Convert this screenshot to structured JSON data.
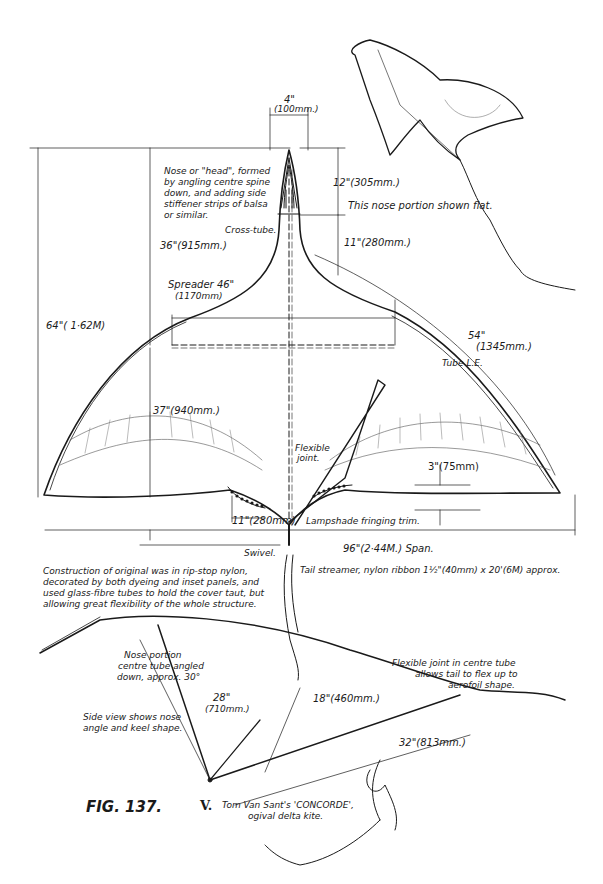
{
  "figure": {
    "number": "FIG. 137.",
    "numeral": "V.",
    "caption_line1": "Tom Van Sant's 'CONCORDE',",
    "caption_line2": "ogival delta kite."
  },
  "plan_view": {
    "nose_width": {
      "inch": "4\"",
      "mm": "(100mm.)"
    },
    "nose_note": [
      "Nose or \"head\", formed",
      "by angling centre spine",
      "down, and adding side",
      "stiffener strips of balsa",
      "or similar."
    ],
    "cross_tube": "Cross-tube.",
    "nose_length": "12\"(305mm.)",
    "nose_flat_note": "This nose portion shown flat.",
    "neck_length": "11\"(280mm.)",
    "head_to_spreader": "36\"(915mm.)",
    "overall_height": "64\"( 1·62M)",
    "spreader": {
      "line1": "Spreader 46\"",
      "line2": "(1170mm)"
    },
    "leading_edge": {
      "inch": "54\"",
      "mm": "(1345mm.)"
    },
    "tube_le": "Tube L.E.",
    "lower_height": "37\"(940mm.)",
    "flexible_joint": [
      "Flexible",
      "joint."
    ],
    "trailing_drop": "3\"(75mm)",
    "trim_width": "11\"(280mm)",
    "lampshade": "Lampshade fringing trim.",
    "swivel": "Swivel.",
    "span": "96\"(2·44M.) Span.",
    "tail_streamer": "Tail streamer, nylon ribbon 1½\"(40mm) x 20'(6M) approx."
  },
  "construction_note": [
    "Construction of original was in rip-stop nylon,",
    "decorated by both dyeing and inset panels, and",
    "used glass-fibre tubes to hold the cover taut, but",
    "allowing great flexibility of the whole structure."
  ],
  "side_view": {
    "nose_note": [
      "Nose portion",
      "centre tube angled",
      "down, approx. 30°"
    ],
    "side_note": [
      "Side view shows nose",
      "angle and keel shape."
    ],
    "keel_front": {
      "inch": "28\"",
      "mm": "(710mm.)"
    },
    "keel_height": "18\"(460mm.)",
    "keel_rear": "32\"(813mm.)",
    "flex_note": [
      "Flexible joint in centre tube",
      "allows tail to flex up to",
      "aerofoil shape."
    ]
  },
  "colors": {
    "ink": "#1a1a1a",
    "paper": "#ffffff",
    "hatch": "#777777"
  }
}
